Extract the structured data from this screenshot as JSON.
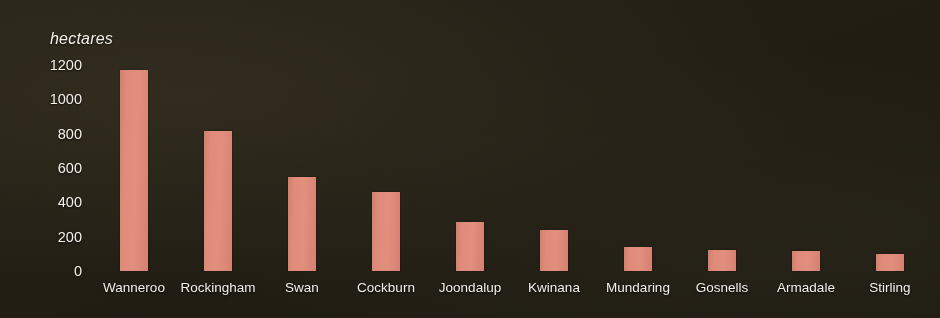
{
  "chart_data": {
    "type": "bar",
    "title": "",
    "subtitle": "",
    "xlabel": "",
    "ylabel": "hectares",
    "ylim": [
      0,
      1200
    ],
    "yticks": [
      1200,
      1000,
      800,
      600,
      400,
      200,
      0
    ],
    "grid": false,
    "legend": null,
    "categories": [
      "Wanneroo",
      "Rockingham",
      "Swan",
      "Cockburn",
      "Joondalup",
      "Kwinana",
      "Mundaring",
      "Gosnells",
      "Armadale",
      "Stirling"
    ],
    "values": [
      1170,
      815,
      545,
      460,
      285,
      240,
      140,
      120,
      115,
      100
    ],
    "bar_color": "#e28b79",
    "background_color": "#221e14",
    "text_color": "#f2efe8"
  }
}
